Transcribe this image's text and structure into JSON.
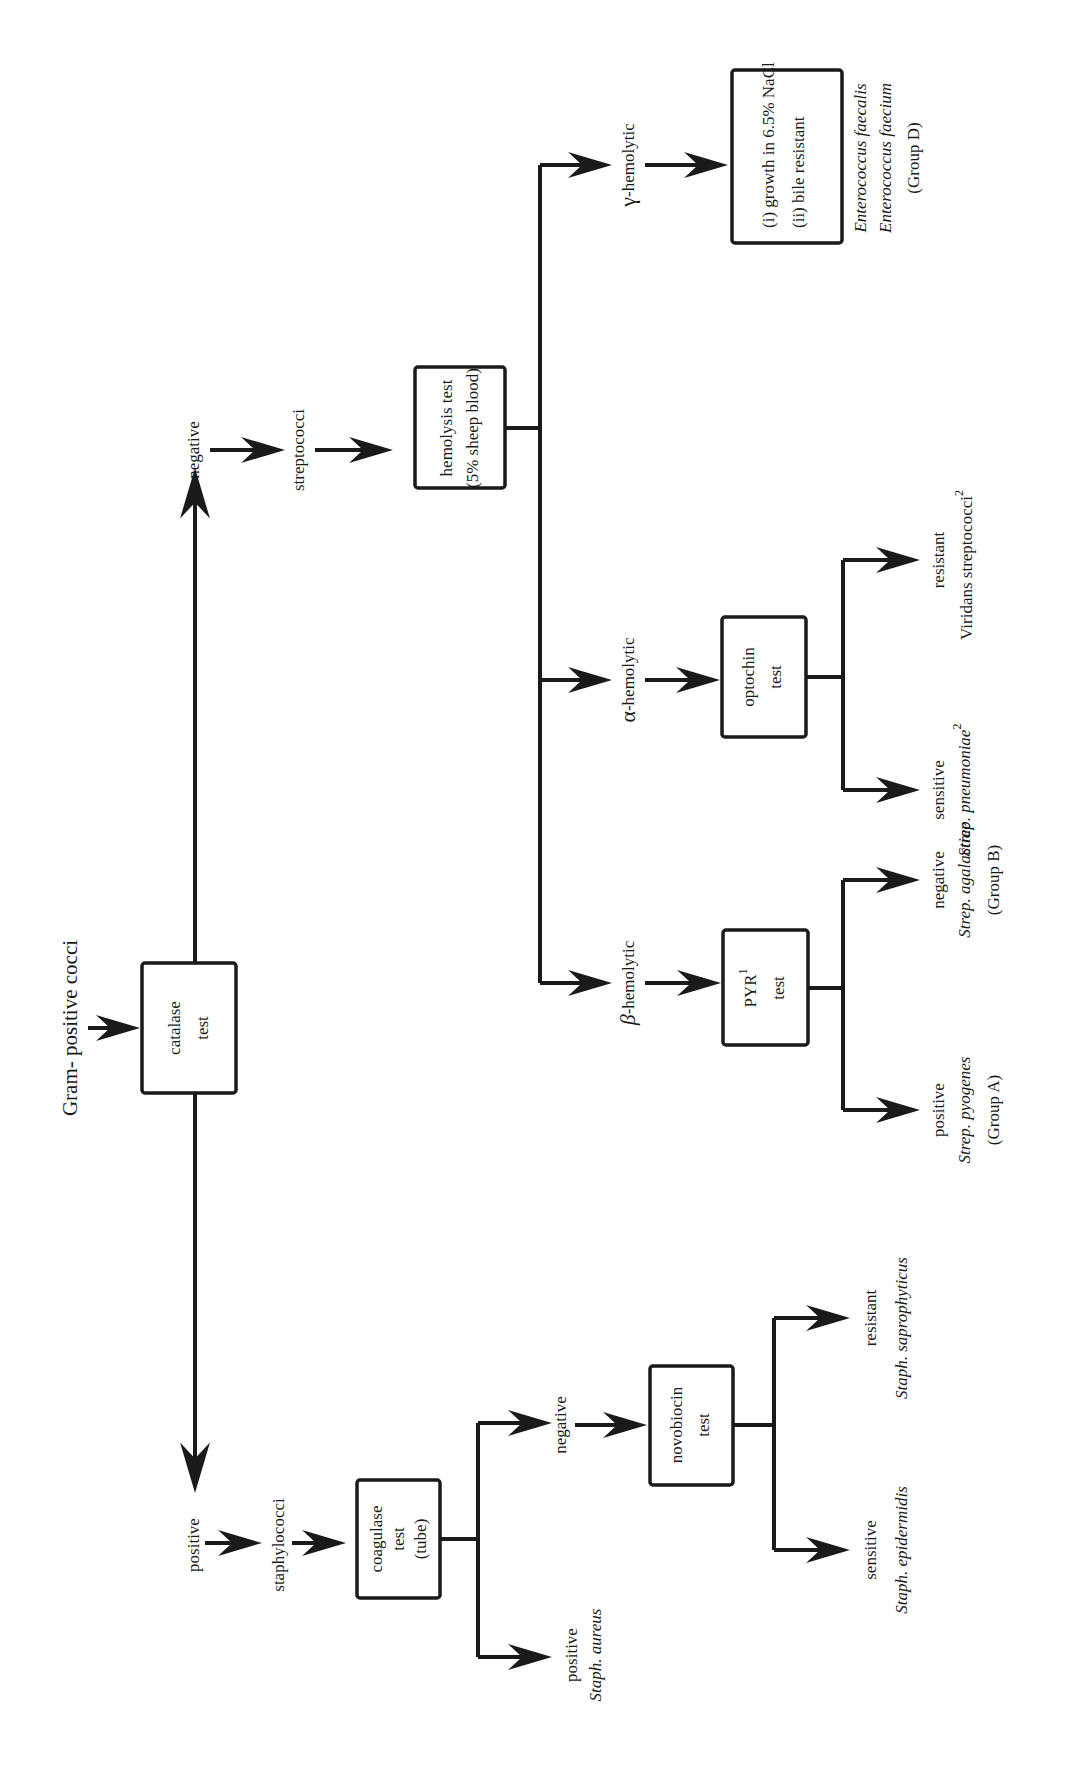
{
  "diagram": {
    "start_label": "Gram- positive cocci",
    "nodes": {
      "catalase": [
        "catalase",
        "test"
      ],
      "coagulase": [
        "coagulase",
        "test",
        "(tube)"
      ],
      "novobiocin": [
        "novobiocin",
        "test"
      ],
      "hemolysis": [
        "hemolysis test",
        "(5% sheep blood)"
      ],
      "optochin": [
        "optochin",
        "test"
      ],
      "pyr": [
        "PYR",
        "test"
      ],
      "pyr_superscript": "1",
      "gamma_box": [
        "(i) growth in 6.5% NaCl",
        "(ii) bile resistant"
      ]
    },
    "labels": {
      "catalase_positive": "positive",
      "staphylococci": "staphylococci",
      "catalase_negative": "negative",
      "streptococci": "streptococci",
      "coagulase_positive": "positive",
      "staph_aureus": "Staph. aureus",
      "coagulase_negative": "negative",
      "novobiocin_sensitive": "sensitive",
      "staph_epidermidis": "Staph. epidermidis",
      "novobiocin_resistant": "resistant",
      "staph_saprophyticus": "Staph. saprophyticus",
      "beta_symbol": "β",
      "beta_hemolytic": "-hemolytic",
      "alpha_symbol": "α",
      "alpha_hemolytic": "-hemolytic",
      "gamma_symbol": "γ",
      "gamma_hemolytic": "-hemolytic",
      "pyr_positive": "positive",
      "strep_pyogenes": "Strep. pyogenes",
      "group_a": "(Group A)",
      "pyr_negative": "negative",
      "strep_agalactiae": "Strep. agalactiae",
      "group_b": "(Group B)",
      "optochin_sensitive": "sensitive",
      "strep_pneumoniae": "Strep. pneumoniae",
      "strep_pneumoniae_sup": "2",
      "optochin_resistant": "resistant",
      "viridans": "Viridans  streptococci",
      "viridans_sup": "2",
      "enterococcus_faecalis": "Enterococcus faecalis",
      "enterococcus_faecium": "Enterococcus  faecium",
      "group_d": "(Group D)"
    },
    "colors": {
      "ink": "#1a1a1a",
      "background": "#ffffff"
    }
  }
}
